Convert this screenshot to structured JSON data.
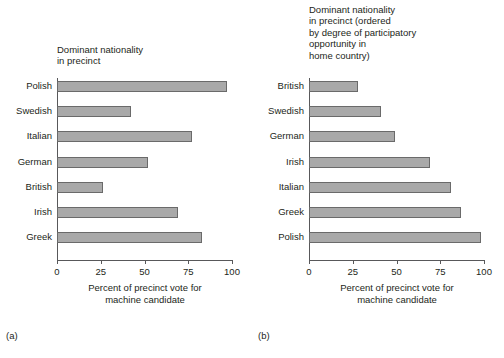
{
  "figure": {
    "background": "#ffffff",
    "bar_fill": "#a9a9a9",
    "bar_stroke": "#6a6a6a",
    "axis_color": "#58585a",
    "text_color": "#231f20"
  },
  "chart_data": [
    {
      "type": "bar",
      "orientation": "horizontal",
      "panel": "a",
      "caption": "(a)",
      "title": "Dominant nationality\nin precinct",
      "xlabel": "Percent of precinct vote for\nmachine candidate",
      "ylabel": "",
      "categories": [
        "Polish",
        "Swedish",
        "Italian",
        "German",
        "British",
        "Irish",
        "Greek"
      ],
      "values": [
        97,
        42,
        77,
        52,
        26,
        69,
        83
      ],
      "xlim": [
        0,
        100
      ],
      "xticks": [
        0,
        25,
        50,
        75,
        100
      ],
      "xticklabels": [
        "0",
        "25",
        "50",
        "75",
        "100"
      ],
      "grid": false,
      "legend": false
    },
    {
      "type": "bar",
      "orientation": "horizontal",
      "panel": "b",
      "caption": "(b)",
      "title": "Dominant nationality\nin precinct (ordered\nby degree of participatory\nopportunity in\nhome country)",
      "xlabel": "Percent of precinct vote for\nmachine candidate",
      "ylabel": "",
      "categories": [
        "British",
        "Swedish",
        "German",
        "Irish",
        "Italian",
        "Greek",
        "Polish"
      ],
      "values": [
        28,
        41,
        49,
        69,
        81,
        87,
        98
      ],
      "xlim": [
        0,
        100
      ],
      "xticks": [
        0,
        25,
        50,
        75,
        100
      ],
      "xticklabels": [
        "0",
        "25",
        "50",
        "75",
        "100"
      ],
      "grid": false,
      "legend": false
    }
  ]
}
